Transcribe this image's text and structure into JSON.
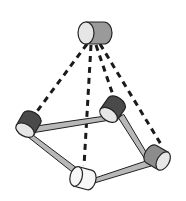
{
  "diagram": {
    "colors": {
      "background": "#ffffff",
      "outline": "#222222",
      "dashed_link": "#1a1a1a",
      "rod": "#b8b8b8",
      "face_light": "#e6e6e6",
      "body_dark": "#4a4a4a",
      "body_mid": "#8c8c8c",
      "body_white": "#f7f7f7",
      "hub_body": "#9a9a9a"
    },
    "nodes": [
      {
        "id": "hub",
        "role": "central",
        "shade": "mid"
      },
      {
        "id": "left",
        "role": "ring",
        "shade": "dark"
      },
      {
        "id": "back-right",
        "role": "ring",
        "shade": "dark"
      },
      {
        "id": "front-right",
        "role": "ring",
        "shade": "mid"
      },
      {
        "id": "front",
        "role": "ring",
        "shade": "white"
      }
    ],
    "dashed_links": [
      {
        "from": "hub",
        "to": "left"
      },
      {
        "from": "hub",
        "to": "front"
      },
      {
        "from": "hub",
        "to": "back-right"
      },
      {
        "from": "hub",
        "to": "front-right"
      }
    ],
    "rods": [
      {
        "from": "left",
        "to": "back-right"
      },
      {
        "from": "back-right",
        "to": "front-right"
      },
      {
        "from": "front-right",
        "to": "front"
      },
      {
        "from": "front",
        "to": "left"
      }
    ]
  }
}
